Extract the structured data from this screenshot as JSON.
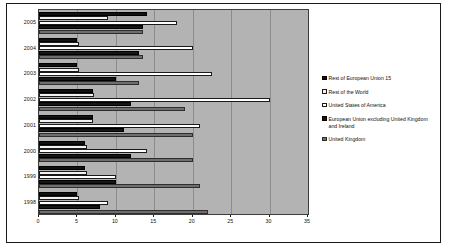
{
  "chart_data": {
    "type": "bar",
    "orientation": "horizontal",
    "title": "",
    "subtitle": "",
    "xlabel": "",
    "ylabel": "",
    "xlim": [
      0,
      35
    ],
    "xticks": [
      0,
      5,
      10,
      15,
      20,
      25,
      30,
      35
    ],
    "grid": true,
    "legend_position": "right",
    "categories": [
      "2005",
      "2004",
      "2003",
      "2002",
      "2001",
      "2000",
      "1999",
      "1998"
    ],
    "series": [
      {
        "name": "Rest of European Union 15",
        "color": "#111111",
        "values": [
          14.0,
          5.0,
          5.0,
          7.0,
          7.0,
          6.0,
          6.0,
          5.0
        ]
      },
      {
        "name": "Rest of the World",
        "color": "#f2f2f2",
        "values": [
          9.0,
          5.2,
          5.2,
          7.2,
          7.0,
          6.2,
          6.2,
          5.2
        ]
      },
      {
        "name": "United States of America",
        "color": "#ffffff",
        "values": [
          18.0,
          20.0,
          22.5,
          30.0,
          21.0,
          14.0,
          10.0,
          9.0
        ]
      },
      {
        "name": "European Union excluding United Kingdom and Ireland",
        "color": "#151515",
        "values": [
          13.5,
          13.0,
          10.0,
          12.0,
          11.0,
          12.0,
          10.0,
          8.0
        ]
      },
      {
        "name": "United Kingdom",
        "color": "#6e6e6e",
        "values": [
          13.5,
          13.5,
          13.0,
          19.0,
          20.0,
          20.0,
          21.0,
          22.0
        ]
      }
    ]
  },
  "legend": {
    "items": [
      {
        "label": "Rest of European Union 15",
        "swatch": "legend-swatch-black"
      },
      {
        "label": "Rest of the World",
        "swatch": "legend-swatch-light"
      },
      {
        "label": "United States of America",
        "swatch": "legend-swatch-white"
      },
      {
        "label": "European Union excluding United Kingdom and Ireland",
        "swatch": "legend-swatch-dark"
      },
      {
        "label": "United Kingdom",
        "swatch": "legend-swatch-gray"
      }
    ]
  }
}
